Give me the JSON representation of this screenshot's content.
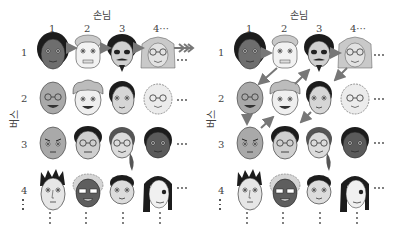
{
  "diagram": {
    "header_label": "손님",
    "vertical_label": "버스",
    "column_labels": [
      "1",
      "2",
      "3",
      "4···"
    ],
    "row_labels": [
      "1",
      "2",
      "3",
      "4"
    ],
    "ellipsis": "···",
    "colors": {
      "arrow": "#777777",
      "skin_dark": "#6e6e6e",
      "skin_mid": "#a9a9a9",
      "skin_light": "#d8d8d8",
      "skin_pale": "#ececec",
      "hair_black": "#1c1c1c",
      "hair_gray": "#c9c9c9"
    },
    "panels": [
      {
        "id": "left",
        "description": "Row 1 only: horizontal arrows 1→2→3→4→···"
      },
      {
        "id": "right",
        "description": "Diagonal zigzag enumeration: (1,1)→(1,2)→(2,1)→(3,1)→(2,2)→(1,3)→(1,4)→(2,3)→(3,2)→···"
      }
    ],
    "faces": [
      [
        "dark-skin black hair",
        "pale old man gray hair",
        "black hair mustache goatee",
        "long gray hair"
      ],
      [
        "bald old man glasses",
        "curly hair boy",
        "short black hair woman",
        "curly white hair glasses"
      ],
      [
        "bald angry man",
        "glasses black hair",
        "ponytail woman glasses",
        "dark-skin woman"
      ],
      [
        "spiky black hair",
        "dark curly hair glasses",
        "short hair child",
        "long black hair woman"
      ]
    ]
  }
}
